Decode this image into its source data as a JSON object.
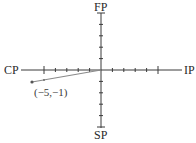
{
  "diagram": {
    "type": "coordinate-plane",
    "axes": {
      "positive_x_label": "IP",
      "negative_x_label": "CP",
      "positive_y_label": "FP",
      "negative_y_label": "SP",
      "range_x": [
        -5,
        5
      ],
      "range_y": [
        -5,
        5
      ],
      "tick_step": 1,
      "major_ticks": [
        -5,
        5
      ]
    },
    "vector": {
      "from": [
        0,
        0
      ],
      "to": [
        -5,
        -1
      ],
      "label": "(−5,−1)"
    },
    "colors": {
      "axis": "#3a3a3a",
      "vector": "#8a8a8a",
      "point": "#555555",
      "text": "#2a2a2a"
    }
  }
}
